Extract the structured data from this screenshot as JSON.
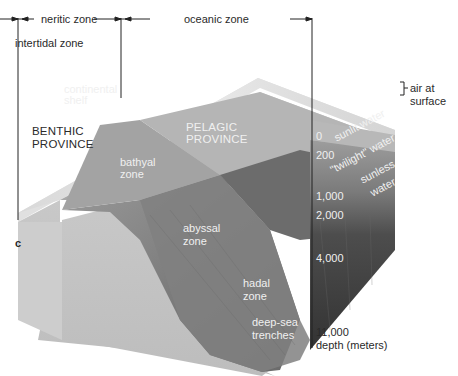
{
  "figure": {
    "panel_label": "c",
    "colors": {
      "background": "#ffffff",
      "surface_top": "#e6e6e6",
      "front_face_light": "#c4c4c4",
      "slope_mid": "#8c8c8c",
      "deep_water": "#3c3c3c",
      "label_dark": "#2a2a2a",
      "label_light": "#f0f0f0"
    }
  },
  "top_zones": {
    "neritic": "neritic zone",
    "oceanic": "oceanic zone",
    "intertidal": "intertidal zone"
  },
  "right_labels": {
    "air": "air at",
    "air_line2": "surface"
  },
  "benthic": {
    "line1": "BENTHIC",
    "line2": "PROVINCE"
  },
  "pelagic": {
    "line1": "PELAGIC",
    "line2": "PROVINCE"
  },
  "seafloor_zones": {
    "shelf_line1": "continental",
    "shelf_line2": "shelf",
    "bathyal_line1": "bathyal",
    "bathyal_line2": "zone",
    "abyssal_line1": "abyssal",
    "abyssal_line2": "zone",
    "hadal_line1": "hadal",
    "hadal_line2": "zone",
    "trench_line1": "deep-sea",
    "trench_line2": "trenches"
  },
  "water_layers": {
    "sunlit": "sunlit water",
    "twilight": "\"twilight\" water",
    "sunless_line1": "sunless",
    "sunless_line2": "water"
  },
  "depth_scale": {
    "ticks": [
      "0",
      "200",
      "1,000",
      "2,000",
      "4,000",
      "11,000"
    ],
    "unit_label": "depth (meters)"
  }
}
